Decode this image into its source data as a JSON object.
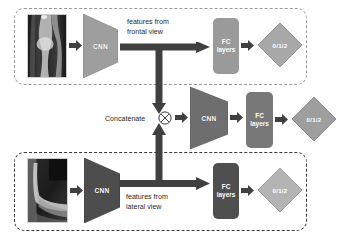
{
  "figure": {
    "branches": [
      {
        "id": "frontal",
        "input_label": "frontal-xray",
        "cnn_label": "CNN",
        "feature_note": "features from\nfrontal view",
        "fc_label_line1": "FC",
        "fc_label_line2": "layers",
        "output_label": "0/1/2",
        "cnn_color": "#9e9e9e",
        "fc_color": "#9a9a9a",
        "diamond_color": "#a8a8a8",
        "border_color": "#9a9a9a"
      },
      {
        "id": "lateral",
        "input_label": "lateral-xray",
        "cnn_label": "CNN",
        "feature_note": "features from\nlateral view",
        "fc_label_line1": "FC",
        "fc_label_line2": "layers",
        "output_label": "0/1/2",
        "cnn_color": "#4d4d4d",
        "fc_color": "#4f4f4f",
        "diamond_color": "#b4b4b4",
        "border_color": "#3a3a3a"
      }
    ],
    "fusion": {
      "concat_label": "Concatenate",
      "concat_symbol": "circled-times",
      "cnn_label": "CNN",
      "fc_label_line1": "FC",
      "fc_label_line2": "layers",
      "output_label": "0/1/2",
      "cnn_color": "#6e6e6e",
      "fc_color": "#787878",
      "diamond_color": "#9e9e9e"
    },
    "colors": {
      "arrow": "#404040",
      "text": "#2a2a2a",
      "background": "#ffffff"
    }
  }
}
